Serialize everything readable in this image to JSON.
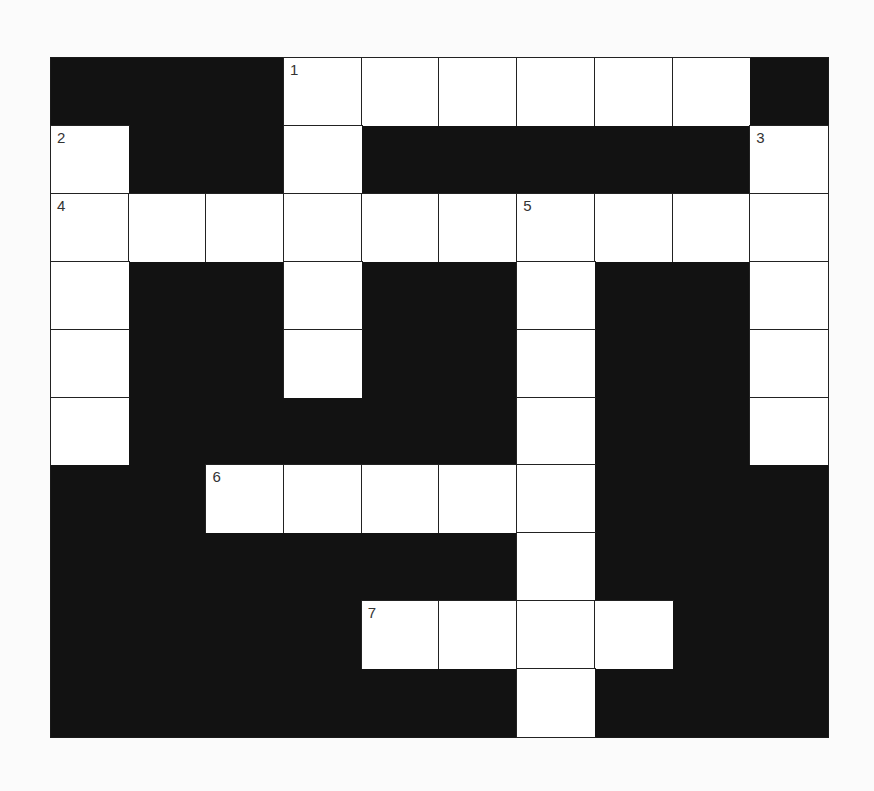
{
  "puzzle": {
    "rows": 10,
    "cols": 10,
    "colors": {
      "block": "#121212",
      "open": "#ffffff",
      "line": "#222222"
    },
    "layout": [
      "###OOOOOO#",
      "O##O#####O",
      "OOOOOOOOOO",
      "O##O##O##O",
      "O##O##O##O",
      "O#####O##O",
      "##OOOOO###",
      "######O###",
      "####OOOO##",
      "######O###"
    ],
    "numbers": [
      {
        "row": 0,
        "col": 3,
        "n": "1"
      },
      {
        "row": 1,
        "col": 0,
        "n": "2"
      },
      {
        "row": 1,
        "col": 9,
        "n": "3"
      },
      {
        "row": 2,
        "col": 0,
        "n": "4"
      },
      {
        "row": 2,
        "col": 6,
        "n": "5"
      },
      {
        "row": 6,
        "col": 2,
        "n": "6"
      },
      {
        "row": 8,
        "col": 4,
        "n": "7"
      }
    ]
  }
}
